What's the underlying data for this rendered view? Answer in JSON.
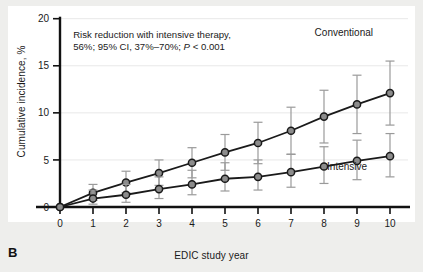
{
  "panel": {
    "label": "B"
  },
  "chart_data": {
    "type": "line",
    "title": "",
    "xlabel": "EDIC study year",
    "ylabel": "Cumulative incidence, %",
    "xlim": [
      0,
      10
    ],
    "ylim": [
      0,
      20
    ],
    "xticks": [
      0,
      1,
      2,
      3,
      4,
      5,
      6,
      7,
      8,
      9,
      10
    ],
    "yticks": [
      0,
      5,
      10,
      15,
      20
    ],
    "xticklabels": [
      "0",
      "1",
      "2",
      "3",
      "4",
      "5",
      "6",
      "7",
      "8",
      "9",
      "10"
    ],
    "yticklabels": [
      "0",
      "5",
      "10",
      "15",
      "20"
    ],
    "grid": true,
    "legend_position": "inline-labels",
    "x": [
      0,
      1,
      2,
      3,
      4,
      5,
      6,
      7,
      8,
      9,
      10
    ],
    "series": [
      {
        "name": "Conventional",
        "label": "Conventional",
        "values": [
          0.0,
          1.5,
          2.6,
          3.6,
          4.7,
          5.8,
          6.8,
          8.1,
          9.6,
          10.9,
          12.1
        ],
        "err_low": [
          0.0,
          0.7,
          1.5,
          2.3,
          3.1,
          3.9,
          4.6,
          5.6,
          6.8,
          7.8,
          8.7
        ],
        "err_high": [
          0.0,
          2.4,
          3.8,
          5.0,
          6.3,
          7.7,
          9.0,
          10.6,
          12.4,
          14.0,
          15.5
        ],
        "label_x": 8.6,
        "label_y": 18.2
      },
      {
        "name": "Intensive",
        "label": "Intensive",
        "values": [
          0.0,
          0.9,
          1.3,
          1.9,
          2.4,
          3.0,
          3.2,
          3.7,
          4.3,
          4.9,
          5.4
        ],
        "err_low": [
          0.0,
          0.3,
          0.5,
          0.9,
          1.3,
          1.7,
          1.8,
          2.1,
          2.5,
          2.9,
          3.2
        ],
        "err_high": [
          0.0,
          1.8,
          2.4,
          3.2,
          3.9,
          4.7,
          5.0,
          5.6,
          6.4,
          7.1,
          7.8
        ],
        "label_x": 8.7,
        "label_y": 3.9
      }
    ],
    "annotations": [
      {
        "line1": "Risk reduction with intensive therapy,",
        "line2_a": "56%; 95% CI, 37%–70%; ",
        "line2_italic": "P",
        "line2_b": " < 0.001",
        "x": 0.4,
        "y": 17.9
      }
    ],
    "colors": {
      "line": "#1a1a1a",
      "marker_face": "#8c8c8c",
      "marker_edge": "#1a1a1a",
      "errorbar": "#9a9a9a",
      "axis": "#111111",
      "grid": "#e8e8e8",
      "background": "#ffffff",
      "page": "#eeeeec"
    }
  }
}
